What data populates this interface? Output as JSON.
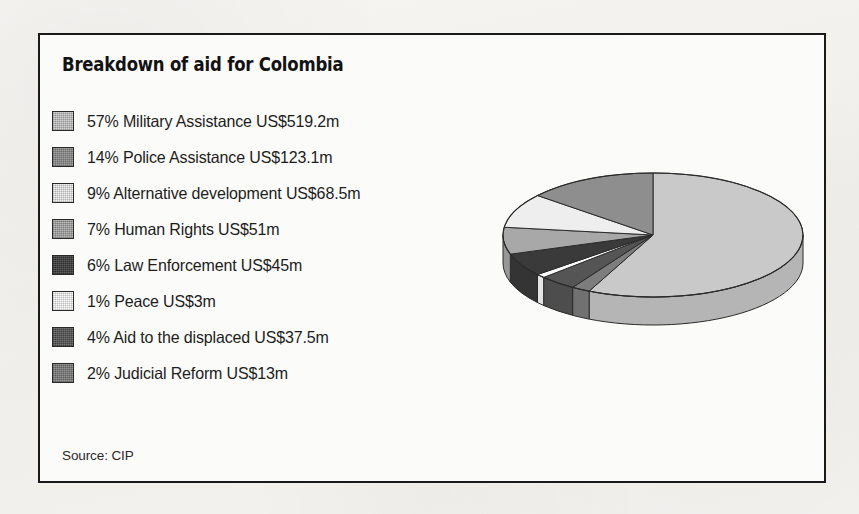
{
  "figure": {
    "title": "Breakdown of aid for Colombia",
    "source": "Source: CIP",
    "background_color": "#f3f2ef",
    "panel_color": "#fbfbf9",
    "frame_color": "#1a1a1a"
  },
  "legend": {
    "items": [
      {
        "label": "57% Military Assistance US$519.2m",
        "swatch": "swatch-military",
        "color": "#c9c9c9"
      },
      {
        "label": "14% Police Assistance US$123.1m",
        "swatch": "swatch-police",
        "color": "#8e8e8e"
      },
      {
        "label": "9% Alternative development US$68.5m",
        "swatch": "swatch-alternative",
        "color": "#eeeeee"
      },
      {
        "label": "7% Human Rights US$51m",
        "swatch": "swatch-human-rights",
        "color": "#a8a8a8"
      },
      {
        "label": "6% Law Enforcement US$45m",
        "swatch": "swatch-law",
        "color": "#3a3a3a"
      },
      {
        "label": "1% Peace US$3m",
        "swatch": "swatch-peace",
        "color": "#fdfdfd"
      },
      {
        "label": "4% Aid to the displaced US$37.5m",
        "swatch": "swatch-displaced",
        "color": "#555555"
      },
      {
        "label": "2% Judicial Reform US$13m",
        "swatch": "swatch-judicial",
        "color": "#7d7d7d"
      }
    ]
  },
  "chart_data": {
    "type": "pie",
    "title": "Breakdown of aid for Colombia",
    "subtitle": "",
    "xlabel": "",
    "ylabel": "",
    "style": "3d-pie",
    "legend_position": "left",
    "grid": false,
    "currency": "US$",
    "units": "millions",
    "total_value": 860.3,
    "start_angle_deg": 0,
    "direction": "clockwise",
    "categories": [
      "Military Assistance",
      "Police Assistance",
      "Alternative development",
      "Human Rights",
      "Law Enforcement",
      "Peace",
      "Aid to the displaced",
      "Judicial Reform"
    ],
    "percentages": [
      57,
      14,
      9,
      7,
      6,
      1,
      4,
      2
    ],
    "values": [
      519.2,
      123.1,
      68.5,
      51,
      45,
      3,
      37.5,
      13
    ],
    "value_labels": [
      "US$519.2m",
      "US$123.1m",
      "US$68.5m",
      "US$51m",
      "US$45m",
      "US$3m",
      "US$37.5m",
      "US$13m"
    ],
    "slice_colors": [
      "#c9c9c9",
      "#8e8e8e",
      "#eeeeee",
      "#a8a8a8",
      "#3a3a3a",
      "#fdfdfd",
      "#555555",
      "#7d7d7d"
    ],
    "slice_order_clockwise_from_top": [
      "Military Assistance",
      "Judicial Reform",
      "Aid to the displaced",
      "Peace",
      "Law Enforcement",
      "Human Rights",
      "Alternative development",
      "Police Assistance"
    ],
    "source": "Source: CIP"
  }
}
